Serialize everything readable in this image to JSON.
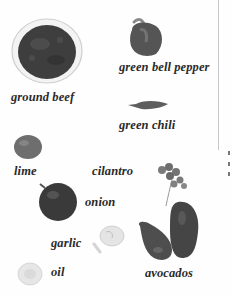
{
  "page": {
    "type": "ingredient illustration",
    "colors": {
      "background": "#fefefe",
      "text": "#2a2a2a",
      "beef": "#3e3e3e",
      "pepper": "#555555",
      "lime": "#6e6e6e",
      "onion": "#3a3a3a",
      "avocado": "#4a4a4a",
      "garlic": "#e4e4e4",
      "oil": "#dcdcdc"
    }
  },
  "ingredients": [
    {
      "id": "ground-beef",
      "label": "ground beef"
    },
    {
      "id": "green-bell-pepper",
      "label": "green bell pepper"
    },
    {
      "id": "green-chili",
      "label": "green chili"
    },
    {
      "id": "lime",
      "label": "lime"
    },
    {
      "id": "cilantro",
      "label": "cilantro"
    },
    {
      "id": "onion",
      "label": "onion"
    },
    {
      "id": "garlic",
      "label": "garlic"
    },
    {
      "id": "oil",
      "label": "oil"
    },
    {
      "id": "avocados",
      "label": "avocados"
    }
  ]
}
